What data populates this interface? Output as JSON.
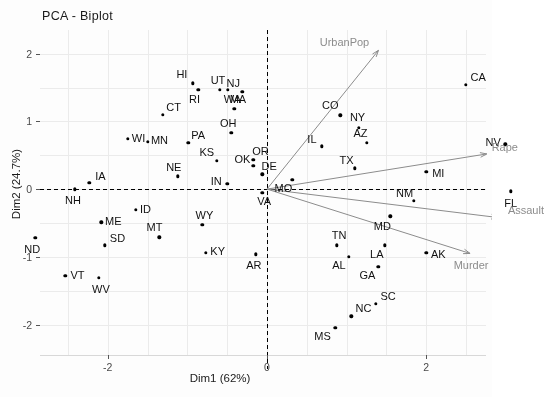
{
  "chart_data": {
    "type": "scatter",
    "title": "PCA - Biplot",
    "xlabel": "Dim1 (62%)",
    "ylabel": "Dim2 (24.7%)",
    "xlim": [
      -2.85,
      2.75
    ],
    "ylim": [
      -2.45,
      2.35
    ],
    "xticks": [
      -2,
      0,
      2
    ],
    "yticks": [
      2,
      1,
      0,
      -1,
      -2
    ],
    "grid": true,
    "legend": "none",
    "point_color": "#000000",
    "vector_color": "#8c8c8c",
    "axis_color": "#000000",
    "origin_lines": "dashed",
    "points": [
      {
        "label": "HI",
        "x": -0.93,
        "y": 1.56
      },
      {
        "label": "UT",
        "x": -0.59,
        "y": 1.47
      },
      {
        "label": "RI",
        "x": -0.86,
        "y": 1.47
      },
      {
        "label": "MA",
        "x": -0.49,
        "y": 1.47
      },
      {
        "label": "NJ",
        "x": -0.31,
        "y": 1.44
      },
      {
        "label": "CT",
        "x": -1.31,
        "y": 1.1
      },
      {
        "label": "WA",
        "x": -0.41,
        "y": 1.19
      },
      {
        "label": "CO",
        "x": 0.92,
        "y": 1.09
      },
      {
        "label": "NY",
        "x": 1.15,
        "y": 0.91
      },
      {
        "label": "CA",
        "x": 2.5,
        "y": 1.54
      },
      {
        "label": "OH",
        "x": -0.45,
        "y": 0.83
      },
      {
        "label": "WI",
        "x": -1.75,
        "y": 0.74
      },
      {
        "label": "MN",
        "x": -1.5,
        "y": 0.7
      },
      {
        "label": "PA",
        "x": -0.99,
        "y": 0.68
      },
      {
        "label": "AZ",
        "x": 1.25,
        "y": 0.68
      },
      {
        "label": "NV",
        "x": 2.99,
        "y": 0.66
      },
      {
        "label": "IL",
        "x": 0.69,
        "y": 0.63
      },
      {
        "label": "OR",
        "x": -0.17,
        "y": 0.43
      },
      {
        "label": "KS",
        "x": -0.63,
        "y": 0.42
      },
      {
        "label": "OK",
        "x": -0.17,
        "y": 0.34
      },
      {
        "label": "DE",
        "x": -0.06,
        "y": 0.22
      },
      {
        "label": "TX",
        "x": 1.1,
        "y": 0.31
      },
      {
        "label": "MI",
        "x": 2.0,
        "y": 0.26
      },
      {
        "label": "MO",
        "x": 0.32,
        "y": 0.14
      },
      {
        "label": "IA",
        "x": -2.23,
        "y": 0.09
      },
      {
        "label": "NE",
        "x": -1.12,
        "y": 0.19
      },
      {
        "label": "IN",
        "x": -0.5,
        "y": 0.08
      },
      {
        "label": "NH",
        "x": -2.41,
        "y": 0.0
      },
      {
        "label": "VA",
        "x": -0.06,
        "y": -0.05
      },
      {
        "label": "FL",
        "x": 3.06,
        "y": -0.03
      },
      {
        "label": "ID",
        "x": -1.65,
        "y": -0.31
      },
      {
        "label": "NM",
        "x": 1.84,
        "y": -0.17
      },
      {
        "label": "ME",
        "x": -2.08,
        "y": -0.49
      },
      {
        "label": "MT",
        "x": -1.35,
        "y": -0.71
      },
      {
        "label": "WY",
        "x": -0.81,
        "y": -0.53
      },
      {
        "label": "MD",
        "x": 1.55,
        "y": -0.4
      },
      {
        "label": "ND",
        "x": -2.91,
        "y": -0.72
      },
      {
        "label": "SD",
        "x": -2.04,
        "y": -0.83
      },
      {
        "label": "KY",
        "x": -0.77,
        "y": -0.94
      },
      {
        "label": "AR",
        "x": -0.14,
        "y": -0.96
      },
      {
        "label": "TN",
        "x": 0.88,
        "y": -0.83
      },
      {
        "label": "AL",
        "x": 1.03,
        "y": -1.0
      },
      {
        "label": "LA",
        "x": 1.48,
        "y": -0.83
      },
      {
        "label": "AK",
        "x": 2.0,
        "y": -0.94
      },
      {
        "label": "VT",
        "x": -2.53,
        "y": -1.28
      },
      {
        "label": "WV",
        "x": -2.11,
        "y": -1.31
      },
      {
        "label": "GA",
        "x": 1.4,
        "y": -1.15
      },
      {
        "label": "SC",
        "x": 1.37,
        "y": -1.69
      },
      {
        "label": "NC",
        "x": 1.06,
        "y": -1.88
      },
      {
        "label": "MS",
        "x": 0.86,
        "y": -2.05
      }
    ],
    "vectors": [
      {
        "label": "UrbanPop",
        "x": 1.4,
        "y": 2.05
      },
      {
        "label": "Rape",
        "x": 2.76,
        "y": 0.52
      },
      {
        "label": "Assault",
        "x": 2.9,
        "y": -0.42
      },
      {
        "label": "Murder",
        "x": 2.55,
        "y": -0.95
      }
    ]
  }
}
